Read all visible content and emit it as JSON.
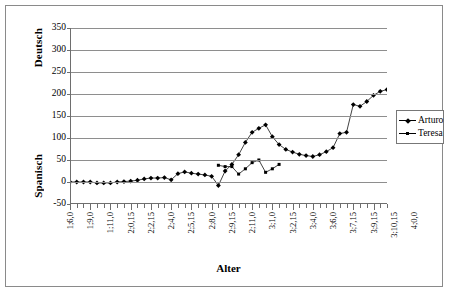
{
  "chart_data": {
    "type": "line",
    "title": "",
    "xlabel": "Alter",
    "ylabel_top": "Deutsch",
    "ylabel_bottom": "Spanisch",
    "ylim": [
      -50,
      350
    ],
    "yticks": [
      -50,
      0,
      50,
      100,
      150,
      200,
      250,
      300,
      350
    ],
    "ytick_labels": [
      "-50",
      "0",
      "50",
      "100",
      "150",
      "200",
      "250",
      "300",
      "350"
    ],
    "grid": true,
    "legend_position": "right",
    "xtick_labels": [
      "1;6,0",
      "1;9,0",
      "1;11,0",
      "2;0,15",
      "2;2,15",
      "2;4,0",
      "2;5,15",
      "2;8,0",
      "2;9,15",
      "2;11,0",
      "3;1,0",
      "3;2,15",
      "3;4,0",
      "3;6,0",
      "3;7,15",
      "3;9,15",
      "3;10,15",
      "4;0,0"
    ],
    "xtick_label_step": 3,
    "n_xticks": 48,
    "series": [
      {
        "name": "Arturo",
        "color": "#000000",
        "x": [
          0,
          1,
          2,
          3,
          4,
          5,
          6,
          7,
          8,
          9,
          10,
          11,
          12,
          13,
          14,
          15,
          16,
          17,
          18,
          19,
          20,
          21,
          22,
          23,
          24,
          25,
          26,
          27,
          28,
          29,
          30,
          31,
          32,
          33,
          34,
          35,
          36,
          37,
          38,
          39,
          40,
          41,
          42,
          43,
          44,
          45,
          46,
          47
        ],
        "values": [
          0,
          0,
          0,
          1,
          0,
          0,
          1,
          2,
          2,
          3,
          5,
          8,
          9,
          10,
          12,
          8,
          18,
          25,
          22,
          20,
          18,
          16,
          14,
          -8,
          22,
          38,
          45,
          60,
          88,
          110,
          122,
          130,
          105,
          85,
          73,
          68,
          64,
          60,
          62,
          68,
          57,
          55,
          62,
          78,
          95,
          118,
          135,
          150
        ]
      },
      {
        "name": "Teresa",
        "color": "#000000",
        "x": [
          22,
          23,
          24,
          25,
          26,
          27,
          28,
          29,
          30,
          31,
          32,
          33,
          34,
          35,
          36,
          37,
          38,
          39,
          40,
          41,
          42,
          43,
          44,
          45,
          46,
          47
        ],
        "values": [
          38,
          null,
          null,
          null,
          null,
          null,
          null,
          null,
          null,
          null,
          null,
          null,
          null,
          null,
          null,
          null,
          null,
          null,
          null,
          null,
          null,
          null,
          null,
          null,
          null,
          null
        ]
      }
    ],
    "arturo_points": [
      [
        0,
        0
      ],
      [
        1,
        0
      ],
      [
        2,
        0
      ],
      [
        3,
        0
      ],
      [
        4,
        -1
      ],
      [
        5,
        -1
      ],
      [
        6,
        -1
      ],
      [
        7,
        0
      ],
      [
        8,
        0
      ],
      [
        9,
        1
      ],
      [
        10,
        3
      ],
      [
        11,
        6
      ],
      [
        12,
        8
      ],
      [
        13,
        8
      ],
      [
        14,
        9
      ],
      [
        15,
        5
      ],
      [
        16,
        18
      ],
      [
        17,
        22
      ],
      [
        18,
        19
      ],
      [
        19,
        17
      ],
      [
        20,
        15
      ],
      [
        21,
        13
      ],
      [
        22,
        -8
      ],
      [
        23,
        24
      ],
      [
        24,
        38
      ],
      [
        25,
        60
      ],
      [
        26,
        88
      ],
      [
        27,
        112
      ],
      [
        28,
        122
      ],
      [
        29,
        130
      ],
      [
        30,
        102
      ],
      [
        31,
        85
      ],
      [
        32,
        73
      ],
      [
        33,
        68
      ],
      [
        34,
        63
      ],
      [
        35,
        60
      ],
      [
        36,
        58
      ],
      [
        37,
        62
      ],
      [
        38,
        68
      ],
      [
        39,
        78
      ],
      [
        40,
        108
      ],
      [
        41,
        112
      ],
      [
        42,
        175
      ],
      [
        43,
        172
      ],
      [
        44,
        182
      ],
      [
        45,
        196
      ],
      [
        46,
        205
      ],
      [
        47,
        210
      ]
    ],
    "legend": [
      {
        "label": "Arturo",
        "marker": "diamond"
      },
      {
        "label": "Teresa",
        "marker": "square"
      }
    ]
  },
  "series_paths": {
    "arturo": "0,0 1,0 2,0 3,0 4,-2 5,-2 6,-2 7,0 8,1 9,2 10,4 11,7 12,9 13,9 14,10 15,5 16,19 17,23 18,20 19,18 20,16 21,13 22,-8 23,25 24,40 25,62 26,90 27,113 28,122 29,130 30,103 31,85 32,74 33,68 34,63 35,60 36,58 37,62 38,69 39,78 40,110 41,113 42,176 43,172 44,183 45,197 46,206 47,210 48,213 49,240 50,245",
    "teresa": "22,38 23,35 24,35 25,18 26,30 27,44 28,50 29,22 30,30 31,40"
  },
  "legend_box": {
    "arturo": "Arturo",
    "teresa": "Teresa"
  }
}
